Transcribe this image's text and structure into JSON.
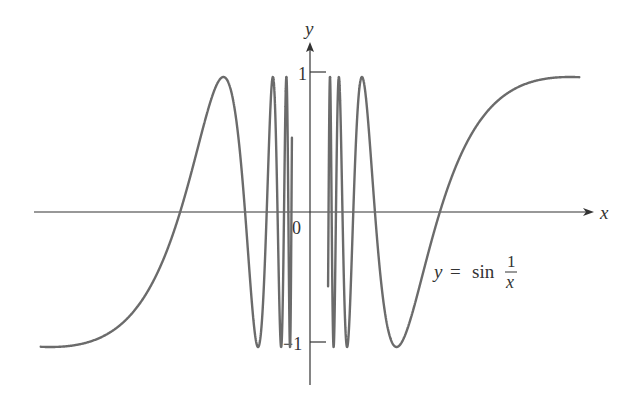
{
  "chart_data": {
    "type": "line",
    "title": "",
    "function": "y = sin(1/x)",
    "xlabel": "x",
    "ylabel": "y",
    "x_range": [
      -0.66,
      0.66
    ],
    "ylim": [
      -1,
      1
    ],
    "y_ticks": [
      {
        "value": 1,
        "label": "1"
      },
      {
        "value": -1,
        "label": "−1"
      }
    ],
    "origin_label": "0",
    "grid": false,
    "legend": null,
    "annotation": {
      "lhs": "y",
      "eq": "=",
      "fn": "sin",
      "num": "1",
      "den": "x"
    },
    "series": [
      {
        "name": "y = sin(1/x)",
        "color": "#6b6b6b",
        "sample_points": [
          {
            "x": -0.66,
            "y": -0.99
          },
          {
            "x": -0.3183,
            "y": 0
          },
          {
            "x": -0.2122,
            "y": 1
          },
          {
            "x": -0.1592,
            "y": 0
          },
          {
            "x": -0.1273,
            "y": -1
          },
          {
            "x": 0.1273,
            "y": 1
          },
          {
            "x": 0.1592,
            "y": 0
          },
          {
            "x": 0.2122,
            "y": -1
          },
          {
            "x": 0.3183,
            "y": 0
          },
          {
            "x": 0.6366,
            "y": 1
          },
          {
            "x": 0.66,
            "y": 0.99
          }
        ]
      }
    ]
  },
  "labels": {
    "x_axis": "x",
    "y_axis": "y",
    "origin": "0",
    "tick_pos": "1",
    "tick_neg": "−1",
    "eq_lhs": "y",
    "eq_sign": "=",
    "eq_fn": "sin",
    "eq_num": "1",
    "eq_den": "x"
  },
  "style": {
    "curve_color": "#6b6b6b",
    "axis_color": "#333333"
  }
}
